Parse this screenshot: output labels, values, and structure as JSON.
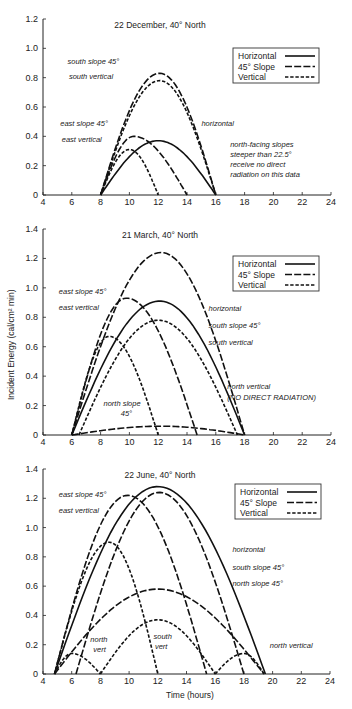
{
  "figure": {
    "ylabel": "Incident Energy (cal/cm² min)",
    "xlabel": "Time (hours)",
    "legend": [
      {
        "label": "Horizontal",
        "style": "solid"
      },
      {
        "label": "45° Slope",
        "style": "long-dash"
      },
      {
        "label": "Vertical",
        "style": "short-dash"
      }
    ]
  },
  "chart_data": [
    {
      "type": "line",
      "title": "22 December, 40° North",
      "xlabel": "",
      "ylabel": "",
      "xlim": [
        4,
        24
      ],
      "ylim": [
        0,
        1.2
      ],
      "xticks": [
        4,
        6,
        8,
        10,
        12,
        14,
        16,
        18,
        20,
        22,
        24
      ],
      "yticks": [
        "0",
        "0.2",
        "0.4",
        "0.6",
        "0.8",
        "1.0",
        "1.2"
      ],
      "series": [
        {
          "name": "south slope 45°",
          "style": "long-dash",
          "start": 8,
          "end": 16,
          "peak_x": 12.1,
          "peak": 0.83
        },
        {
          "name": "south vertical",
          "style": "short-dash",
          "start": 8,
          "end": 16,
          "peak_x": 12.1,
          "peak": 0.78
        },
        {
          "name": "horizontal",
          "style": "solid",
          "start": 8,
          "end": 16,
          "peak_x": 12.0,
          "peak": 0.37
        },
        {
          "name": "east slope 45°",
          "style": "long-dash",
          "start": 8,
          "end": 14,
          "peak_x": 10.3,
          "peak": 0.4
        },
        {
          "name": "east vertical",
          "style": "short-dash",
          "start": 8,
          "end": 12,
          "peak_x": 10.0,
          "peak": 0.31
        }
      ],
      "annotations": [
        {
          "text": "south slope 45°",
          "x": 5.7,
          "y": 0.89
        },
        {
          "text": "south vertical",
          "x": 5.8,
          "y": 0.79
        },
        {
          "text": "east slope 45°",
          "x": 5.2,
          "y": 0.47
        },
        {
          "text": "east vertical",
          "x": 5.3,
          "y": 0.36
        },
        {
          "text": "horizontal",
          "x": 15.0,
          "y": 0.47
        },
        {
          "text": "north-facing slopes",
          "x": 17.0,
          "y": 0.33
        },
        {
          "text": "steeper than 22.5°",
          "x": 17.0,
          "y": 0.26
        },
        {
          "text": "receive no direct",
          "x": 17.0,
          "y": 0.19
        },
        {
          "text": "radiation on this data",
          "x": 17.0,
          "y": 0.12
        }
      ]
    },
    {
      "type": "line",
      "title": "21 March, 40° North",
      "xlabel": "",
      "ylabel": "Incident Energy (cal/cm² min)",
      "xlim": [
        4,
        24
      ],
      "ylim": [
        0,
        1.4
      ],
      "xticks": [
        4,
        6,
        8,
        10,
        12,
        14,
        16,
        18,
        20,
        22,
        24
      ],
      "yticks": [
        "0",
        "0.2",
        "0.4",
        "0.6",
        "0.8",
        "1.0",
        "1.2",
        "1.4"
      ],
      "series": [
        {
          "name": "south slope 45°",
          "style": "long-dash",
          "start": 6,
          "end": 18,
          "peak_x": 12.2,
          "peak": 1.24
        },
        {
          "name": "horizontal",
          "style": "solid",
          "start": 6,
          "end": 18,
          "peak_x": 12.1,
          "peak": 0.91
        },
        {
          "name": "south vertical",
          "style": "short-dash",
          "start": 6.5,
          "end": 17.5,
          "peak_x": 12.0,
          "peak": 0.78
        },
        {
          "name": "east slope 45°",
          "style": "long-dash",
          "start": 6,
          "end": 14.7,
          "peak_x": 9.8,
          "peak": 0.93
        },
        {
          "name": "east vertical",
          "style": "short-dash",
          "start": 6,
          "end": 12,
          "peak_x": 8.6,
          "peak": 0.67
        },
        {
          "name": "north slope 45°",
          "style": "long-dash",
          "start": 6,
          "end": 18,
          "peak_x": 12.2,
          "peak": 0.06
        }
      ],
      "annotations": [
        {
          "text": "east slope 45°",
          "x": 5.1,
          "y": 0.96
        },
        {
          "text": "east vertical",
          "x": 5.1,
          "y": 0.85
        },
        {
          "text": "horizontal",
          "x": 15.5,
          "y": 0.84
        },
        {
          "text": "south slope 45°",
          "x": 15.5,
          "y": 0.73
        },
        {
          "text": "south vertical",
          "x": 15.5,
          "y": 0.61
        },
        {
          "text": "north vertical",
          "x": 16.8,
          "y": 0.31
        },
        {
          "text": "(NO DIRECT RADIATION)",
          "x": 16.8,
          "y": 0.24
        },
        {
          "text": "north slope",
          "x": 8.2,
          "y": 0.2
        },
        {
          "text": "45°",
          "x": 9.4,
          "y": 0.13
        }
      ]
    },
    {
      "type": "line",
      "title": "22 June, 40° North",
      "xlabel": "Time (hours)",
      "ylabel": "",
      "xlim": [
        4,
        24
      ],
      "ylim": [
        0,
        1.4
      ],
      "xticks": [
        4,
        6,
        8,
        10,
        12,
        14,
        16,
        18,
        20,
        22,
        24
      ],
      "yticks": [
        "0",
        "0.2",
        "0.4",
        "0.6",
        "0.8",
        "1.0",
        "1.2",
        "1.4"
      ],
      "series": [
        {
          "name": "horizontal",
          "style": "solid",
          "start": 4.8,
          "end": 19.5,
          "peak_x": 12.0,
          "peak": 1.28
        },
        {
          "name": "south slope 45°",
          "style": "long-dash",
          "start": 6.3,
          "end": 18.0,
          "peak_x": 12.1,
          "peak": 1.24
        },
        {
          "name": "east slope 45°",
          "style": "long-dash",
          "start": 4.8,
          "end": 15.4,
          "peak_x": 9.9,
          "peak": 1.22
        },
        {
          "name": "east vertical",
          "style": "short-dash",
          "start": 4.8,
          "end": 12.0,
          "peak_x": 8.6,
          "peak": 0.9
        },
        {
          "name": "north slope 45°",
          "style": "long-dash",
          "start": 4.8,
          "end": 19.4,
          "peak_x": 12.0,
          "peak": 0.58
        },
        {
          "name": "south vertical",
          "style": "short-dash",
          "start": 8.0,
          "end": 16.0,
          "peak_x": 12.0,
          "peak": 0.37
        },
        {
          "name": "north vertical (morning)",
          "style": "short-dash",
          "start": 4.8,
          "end": 8.0,
          "peak_x": 6.0,
          "peak": 0.14
        },
        {
          "name": "north vertical (evening)",
          "style": "short-dash",
          "start": 16.0,
          "end": 19.4,
          "peak_x": 18.0,
          "peak": 0.14
        }
      ],
      "annotations": [
        {
          "text": "east slope 45°",
          "x": 5.1,
          "y": 1.21
        },
        {
          "text": "east vertical",
          "x": 5.1,
          "y": 1.1
        },
        {
          "text": "horizontal",
          "x": 17.2,
          "y": 0.83
        },
        {
          "text": "south slope 45°",
          "x": 17.2,
          "y": 0.71
        },
        {
          "text": "north slope 45°",
          "x": 17.2,
          "y": 0.6
        },
        {
          "text": "north vertical",
          "x": 19.8,
          "y": 0.18
        },
        {
          "text": "north",
          "x": 7.3,
          "y": 0.22
        },
        {
          "text": "vert",
          "x": 7.5,
          "y": 0.15
        },
        {
          "text": "south",
          "x": 11.7,
          "y": 0.24
        },
        {
          "text": "vert",
          "x": 11.8,
          "y": 0.17
        }
      ]
    }
  ]
}
